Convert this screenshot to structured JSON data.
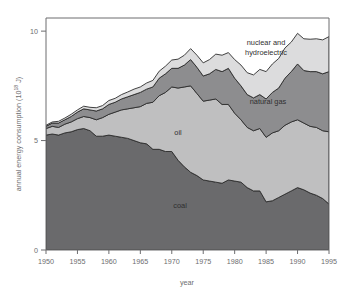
{
  "chart_data": {
    "type": "area",
    "stacked": true,
    "title": "",
    "xlabel": "year",
    "ylabel": "annual energy consumption (10¹⁸ J)",
    "ylabel_parts": {
      "main": "annual energy consumption (10",
      "exponent": "18",
      "tail": " J)"
    },
    "xlim": [
      1950,
      1995
    ],
    "ylim": [
      0,
      10.6
    ],
    "xticks": [
      1950,
      1955,
      1960,
      1965,
      1970,
      1975,
      1980,
      1985,
      1990,
      1995
    ],
    "xtick_labels": [
      "1950",
      "1955",
      "1960",
      "1965",
      "1970",
      "1975",
      "1980",
      "1985",
      "1990",
      "1995"
    ],
    "yticks": [
      0,
      5,
      10
    ],
    "ytick_labels": [
      "0",
      "5",
      "10"
    ],
    "grid": false,
    "legend_position": "inline-annotations",
    "x": [
      1950,
      1951,
      1952,
      1953,
      1954,
      1955,
      1956,
      1957,
      1958,
      1959,
      1960,
      1961,
      1962,
      1963,
      1964,
      1965,
      1966,
      1967,
      1968,
      1969,
      1970,
      1971,
      1972,
      1973,
      1974,
      1975,
      1976,
      1977,
      1978,
      1979,
      1980,
      1981,
      1982,
      1983,
      1984,
      1985,
      1986,
      1987,
      1988,
      1989,
      1990,
      1991,
      1992,
      1993,
      1994,
      1995
    ],
    "series": [
      {
        "name": "coal",
        "label": "coal",
        "color": "#6a6a6c",
        "values": [
          5.25,
          5.3,
          5.25,
          5.35,
          5.4,
          5.5,
          5.55,
          5.45,
          5.2,
          5.2,
          5.25,
          5.2,
          5.15,
          5.1,
          5.0,
          4.9,
          4.85,
          4.6,
          4.6,
          4.5,
          4.5,
          4.1,
          3.8,
          3.55,
          3.4,
          3.2,
          3.15,
          3.1,
          3.05,
          3.2,
          3.15,
          3.1,
          2.85,
          2.7,
          2.7,
          2.2,
          2.25,
          2.4,
          2.55,
          2.7,
          2.85,
          2.75,
          2.6,
          2.5,
          2.35,
          2.1
        ]
      },
      {
        "name": "oil",
        "label": "oil",
        "color": "#bfbfc0",
        "values": [
          0.3,
          0.35,
          0.35,
          0.4,
          0.45,
          0.5,
          0.55,
          0.6,
          0.75,
          0.85,
          0.95,
          1.1,
          1.25,
          1.35,
          1.5,
          1.65,
          1.85,
          2.15,
          2.45,
          2.7,
          2.95,
          3.3,
          3.65,
          3.95,
          3.75,
          3.6,
          3.7,
          3.8,
          3.6,
          3.45,
          3.1,
          2.85,
          2.75,
          2.75,
          2.85,
          2.95,
          3.1,
          3.05,
          3.15,
          3.15,
          3.1,
          3.05,
          3.05,
          3.1,
          3.1,
          3.3
        ]
      },
      {
        "name": "natural gas",
        "label": "natural gas",
        "color": "#8d8d8f",
        "values": [
          0.1,
          0.15,
          0.2,
          0.2,
          0.25,
          0.3,
          0.35,
          0.35,
          0.4,
          0.4,
          0.45,
          0.45,
          0.5,
          0.55,
          0.6,
          0.65,
          0.65,
          0.7,
          0.8,
          0.85,
          0.85,
          0.9,
          1.0,
          1.2,
          1.2,
          1.15,
          1.2,
          1.35,
          1.5,
          1.65,
          1.6,
          1.55,
          1.5,
          1.5,
          1.55,
          1.75,
          1.85,
          1.95,
          2.15,
          2.3,
          2.55,
          2.4,
          2.5,
          2.55,
          2.6,
          2.75
        ]
      },
      {
        "name": "nuclear and hydroelectric",
        "label": "nuclear and\nhydroelectric",
        "label_line1": "nuclear and",
        "label_line2": "hydroelectric",
        "color": "#dcdcdd",
        "values": [
          0.05,
          0.05,
          0.08,
          0.08,
          0.1,
          0.1,
          0.12,
          0.12,
          0.15,
          0.15,
          0.18,
          0.18,
          0.2,
          0.22,
          0.25,
          0.25,
          0.28,
          0.3,
          0.32,
          0.35,
          0.38,
          0.42,
          0.45,
          0.5,
          0.55,
          0.6,
          0.65,
          0.7,
          0.75,
          0.72,
          0.85,
          0.95,
          1.0,
          1.05,
          1.15,
          1.25,
          1.3,
          1.35,
          1.38,
          1.35,
          1.4,
          1.45,
          1.48,
          1.5,
          1.55,
          1.6
        ]
      }
    ]
  },
  "annotations": {
    "coal": "coal",
    "oil": "oil",
    "natural_gas": "natural gas",
    "nuclear_line1": "nuclear and",
    "nuclear_line2": "hydroelectric"
  },
  "colors": {
    "coal": "#6a6a6c",
    "oil": "#bfbfc0",
    "natural_gas": "#8d8d8f",
    "nuclear": "#dcdcdd",
    "axis": "#6d6d6f",
    "outline": "#2c2c2d",
    "background": "#ffffff"
  }
}
